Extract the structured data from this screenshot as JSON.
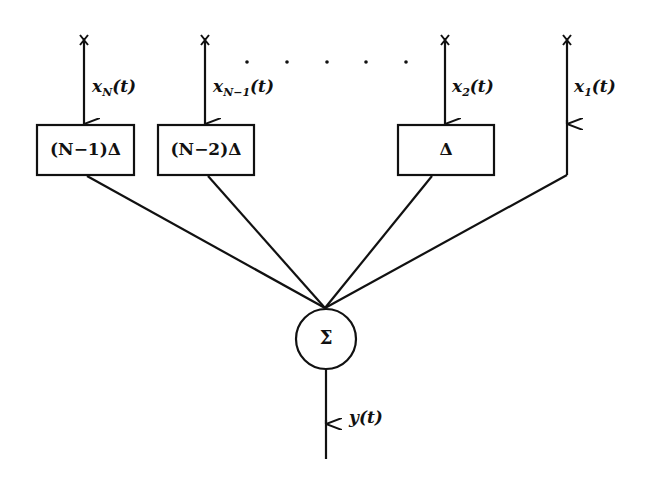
{
  "diagram": {
    "type": "delay-and-sum block diagram",
    "inputs": [
      {
        "id": "xN",
        "label_base": "x",
        "label_sub": "N",
        "label_arg": "(t)",
        "delay_label": "(N−1)Δ"
      },
      {
        "id": "xN-1",
        "label_base": "x",
        "label_sub": "N−1",
        "label_arg": "(t)",
        "delay_label": "(N−2)Δ"
      },
      {
        "id": "x2",
        "label_base": "x",
        "label_sub": "2",
        "label_arg": "(t)",
        "delay_label": "Δ"
      },
      {
        "id": "x1",
        "label_base": "x",
        "label_sub": "1",
        "label_arg": "(t)",
        "delay_label": null
      }
    ],
    "sensor_marker": "x",
    "ellipsis": "· · · · ·",
    "summer": {
      "symbol": "Σ"
    },
    "output": {
      "label": "y(t)"
    },
    "colors": {
      "stroke": "#111111",
      "background": "#ffffff"
    }
  }
}
